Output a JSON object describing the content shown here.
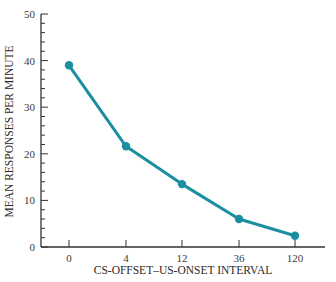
{
  "chart_data": {
    "type": "line",
    "title": "",
    "xlabel": "CS-OFFSET–US-ONSET INTERVAL",
    "ylabel": "MEAN RESPONSES PER MINUTE",
    "categories": [
      "0",
      "4",
      "12",
      "36",
      "120"
    ],
    "series": [
      {
        "name": "Mean responses per minute",
        "values": [
          39,
          21.6,
          13.5,
          6,
          2.4
        ]
      }
    ],
    "ylim": [
      0,
      50
    ],
    "yticks": [
      0,
      10,
      20,
      30,
      40,
      50
    ],
    "y_minor_step": 2,
    "grid": false,
    "legend": null,
    "colors": {
      "line": "#1a8fa0",
      "marker": "#1a8fa0",
      "axis": "#333333"
    }
  }
}
